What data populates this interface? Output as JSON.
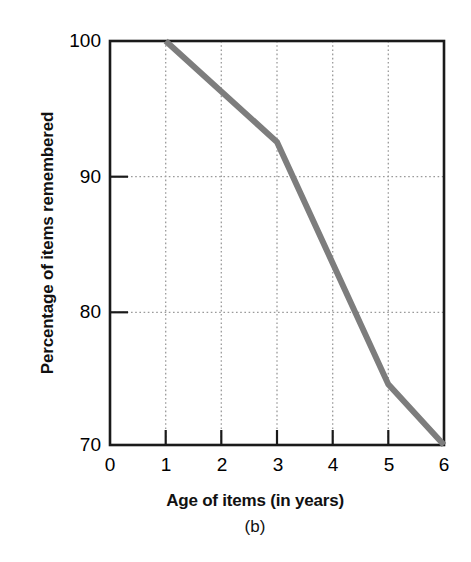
{
  "figure": {
    "panel_label": "(b)",
    "background_color": "#ffffff"
  },
  "axes": {
    "y_title": "Percentage of items remembered",
    "x_title": "Age of items (in years)",
    "y_ticks": [
      "100",
      "90",
      "80",
      "70"
    ],
    "x_ticks": [
      "0",
      "1",
      "2",
      "3",
      "4",
      "5",
      "6"
    ]
  },
  "chart_data": {
    "type": "line",
    "title": "",
    "subtitle": "(b)",
    "xlabel": "Age of items (in years)",
    "ylabel": "Percentage of items remembered",
    "xlim": [
      0,
      6
    ],
    "ylim": [
      70,
      100
    ],
    "xticks": [
      0,
      1,
      2,
      3,
      4,
      5,
      6
    ],
    "yticks": [
      70,
      80,
      90,
      100
    ],
    "xtick_labels": [
      "0",
      "1",
      "2",
      "3",
      "4",
      "5",
      "6"
    ],
    "ytick_labels": [
      "70",
      "80",
      "90",
      "100"
    ],
    "grid": true,
    "grid_style": "dotted",
    "grid_color": "#9a9a9a",
    "legend": null,
    "legend_position": "none",
    "series": [
      {
        "name": "Percentage of items remembered",
        "color": "#7d7d7d",
        "line_width": 6,
        "markers": false,
        "x": [
          1,
          3,
          5,
          6
        ],
        "values": [
          100,
          92.5,
          74.5,
          70
        ]
      }
    ]
  }
}
